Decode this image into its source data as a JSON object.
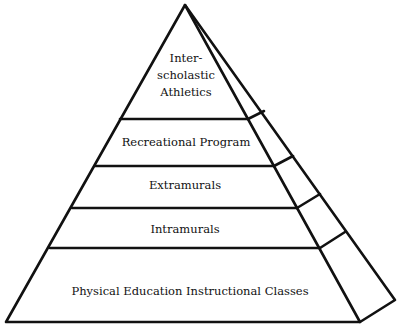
{
  "diagram": {
    "type": "pyramid",
    "tiers": [
      {
        "lines": [
          "Inter-",
          "scholastic",
          "Athletics"
        ],
        "label_x": 186,
        "label_y": 50
      },
      {
        "lines": [
          "Recreational Program"
        ],
        "label_x": 186,
        "label_y": 134
      },
      {
        "lines": [
          "Extramurals"
        ],
        "label_x": 185,
        "label_y": 177
      },
      {
        "lines": [
          "Intramurals"
        ],
        "label_x": 185,
        "label_y": 221
      },
      {
        "lines": [
          "Physical Education Instructional Classes"
        ],
        "label_x": 190,
        "label_y": 283
      }
    ],
    "stroke_color": "#111111",
    "background_color": "#ffffff"
  }
}
